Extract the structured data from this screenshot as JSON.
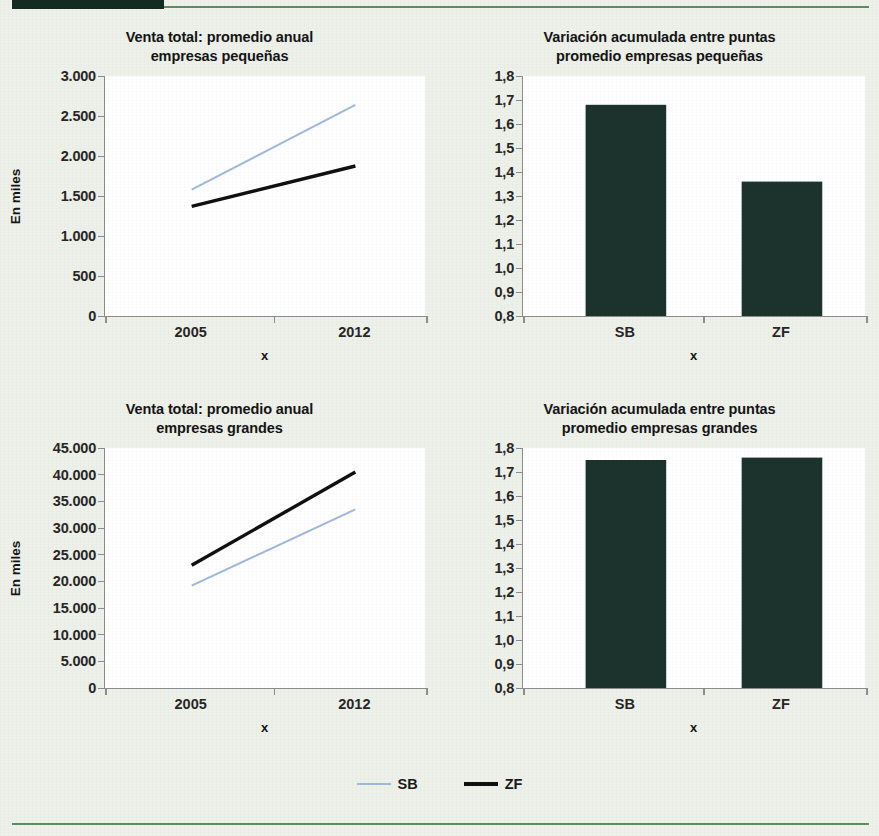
{
  "theme": {
    "page_bg": "#eef0ea",
    "rule_green": "#5b8f5f",
    "block_dark": "#132b20",
    "series_sb_color": "#9fb9dd",
    "series_zf_color": "#101010",
    "bar_color": "#1b332c",
    "axis_color": "#8d8d8d",
    "plot_bg": "#ffffff"
  },
  "legend": {
    "items": [
      {
        "label": "SB",
        "marker": "thin-line-light-blue"
      },
      {
        "label": "ZF",
        "marker": "thick-line-black"
      }
    ]
  },
  "chart_data": [
    {
      "id": "venta-total-pequenas",
      "type": "line",
      "title": "Venta total: promedio anual\nempresas pequeñas",
      "xlabel": "x",
      "ylabel": "En miles",
      "x": [
        "2005",
        "2012"
      ],
      "xticklabels": [
        "2005",
        "2012"
      ],
      "yticklabels": [
        "0",
        "500",
        "1.000",
        "1.500",
        "2.000",
        "2.500",
        "3.000"
      ],
      "yticks": [
        0,
        500,
        1000,
        1500,
        2000,
        2500,
        3000
      ],
      "ylim": [
        0,
        3000
      ],
      "grid": false,
      "legend_position": "figure-bottom-center",
      "series": [
        {
          "name": "SB",
          "values": [
            1580,
            2640
          ],
          "color": "#9fb9dd"
        },
        {
          "name": "ZF",
          "values": [
            1370,
            1875
          ],
          "color": "#101010"
        }
      ]
    },
    {
      "id": "variacion-pequenas",
      "type": "bar",
      "title": "Variación acumulada entre puntas\npromedio empresas pequeñas",
      "xlabel": "x",
      "ylabel": "",
      "categories": [
        "SB",
        "ZF"
      ],
      "values": [
        1.68,
        1.36
      ],
      "yticklabels": [
        "0,8",
        "0,9",
        "1,0",
        "1,1",
        "1,2",
        "1,3",
        "1,4",
        "1,5",
        "1,6",
        "1,7",
        "1,8"
      ],
      "yticks": [
        0.8,
        0.9,
        1.0,
        1.1,
        1.2,
        1.3,
        1.4,
        1.5,
        1.6,
        1.7,
        1.8
      ],
      "ylim": [
        0.8,
        1.8
      ],
      "grid": false,
      "bar_color": "#1b332c"
    },
    {
      "id": "venta-total-grandes",
      "type": "line",
      "title": "Venta total: promedio anual\nempresas grandes",
      "xlabel": "x",
      "ylabel": "En miles",
      "x": [
        "2005",
        "2012"
      ],
      "xticklabels": [
        "2005",
        "2012"
      ],
      "yticklabels": [
        "0",
        "5.000",
        "10.000",
        "15.000",
        "20.000",
        "25.000",
        "30.000",
        "35.000",
        "40.000",
        "45.000"
      ],
      "yticks": [
        0,
        5000,
        10000,
        15000,
        20000,
        25000,
        30000,
        35000,
        40000,
        45000
      ],
      "ylim": [
        0,
        45000
      ],
      "grid": false,
      "series": [
        {
          "name": "SB",
          "values": [
            19200,
            33500
          ],
          "color": "#9fb9dd"
        },
        {
          "name": "ZF",
          "values": [
            23000,
            40500
          ],
          "color": "#101010"
        }
      ]
    },
    {
      "id": "variacion-grandes",
      "type": "bar",
      "title": "Variación acumulada entre puntas\npromedio empresas grandes",
      "xlabel": "x",
      "ylabel": "",
      "categories": [
        "SB",
        "ZF"
      ],
      "values": [
        1.75,
        1.76
      ],
      "yticklabels": [
        "0,8",
        "0,9",
        "1,0",
        "1,1",
        "1,2",
        "1,3",
        "1,4",
        "1,5",
        "1,6",
        "1,7",
        "1,8"
      ],
      "yticks": [
        0.8,
        0.9,
        1.0,
        1.1,
        1.2,
        1.3,
        1.4,
        1.5,
        1.6,
        1.7,
        1.8
      ],
      "ylim": [
        0.8,
        1.8
      ],
      "grid": false,
      "bar_color": "#1b332c"
    }
  ]
}
